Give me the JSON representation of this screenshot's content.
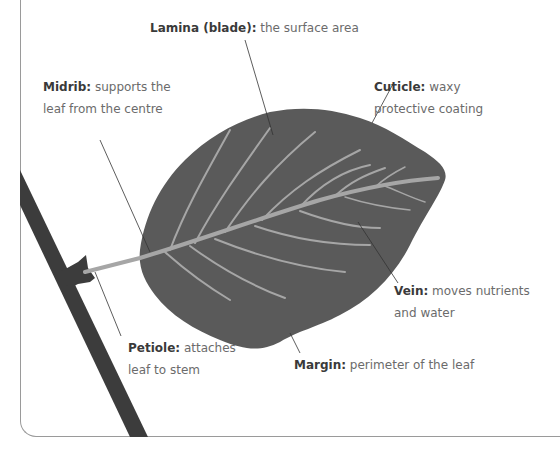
{
  "colors": {
    "leaf": "#5a5a5a",
    "stem": "#3c3c3c",
    "vein": "#a6a6a6",
    "leader": "#333333",
    "frame": "#9a9a9a",
    "label_bold": "#3a3a3a",
    "label_text": "#6b6b6b"
  },
  "labels": {
    "lamina": {
      "term": "Lamina (blade):",
      "desc": "the surface area"
    },
    "midrib": {
      "term": "Midrib:",
      "desc_line1": "supports the",
      "desc_line2": "leaf from the centre"
    },
    "cuticle": {
      "term": "Cuticle:",
      "desc_line1": "waxy",
      "desc_line2": "protective coating"
    },
    "vein": {
      "term": "Vein:",
      "desc_line1": "moves nutrients",
      "desc_line2": "and water"
    },
    "petiole": {
      "term": "Petiole:",
      "desc_line1": "attaches",
      "desc_line2": "leaf to stem"
    },
    "margin": {
      "term": "Margin:",
      "desc": "perimeter of the leaf"
    }
  }
}
